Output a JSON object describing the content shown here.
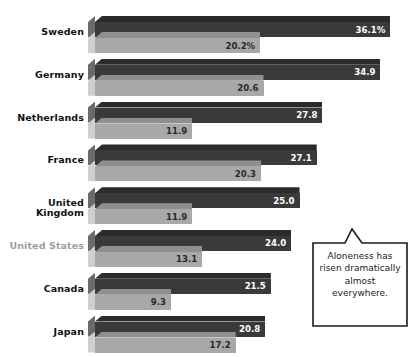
{
  "chart_data": {
    "type": "bar",
    "title": "",
    "subtitle": "",
    "xlabel": "",
    "ylabel": "",
    "orientation": "horizontal",
    "grid": false,
    "legend_position": "top-cropped",
    "xlim": [
      0,
      40
    ],
    "categories": [
      "Sweden",
      "Germany",
      "Netherlands",
      "France",
      "United Kingdom",
      "United States",
      "Canada",
      "Japan"
    ],
    "series": [
      {
        "name": "Recent",
        "color": "#3a3a3a",
        "values": [
          36.1,
          34.9,
          27.8,
          27.1,
          25.0,
          24.0,
          21.5,
          20.8
        ]
      },
      {
        "name": "Earlier",
        "color": "#a8a8a8",
        "values": [
          20.2,
          20.6,
          11.9,
          20.3,
          11.9,
          13.1,
          9.3,
          17.2
        ]
      }
    ],
    "annotations": [
      {
        "text": "Aloneness has risen dramatically almost everywhere.",
        "position": "bottom-right"
      }
    ]
  },
  "legend_remnant": "",
  "rows": [
    {
      "label": "Sweden",
      "muted": false,
      "dark_value": "36.1%",
      "light_value": "20.2%",
      "dark_num": 36.1,
      "light_num": 20.2
    },
    {
      "label": "Germany",
      "muted": false,
      "dark_value": "34.9",
      "light_value": "20.6",
      "dark_num": 34.9,
      "light_num": 20.6
    },
    {
      "label": "Netherlands",
      "muted": false,
      "dark_value": "27.8",
      "light_value": "11.9",
      "dark_num": 27.8,
      "light_num": 11.9
    },
    {
      "label": "France",
      "muted": false,
      "dark_value": "27.1",
      "light_value": "20.3",
      "dark_num": 27.1,
      "light_num": 20.3
    },
    {
      "label": "United Kingdom",
      "muted": false,
      "dark_value": "25.0",
      "light_value": "11.9",
      "dark_num": 25.0,
      "light_num": 11.9
    },
    {
      "label": "United States",
      "muted": true,
      "dark_value": "24.0",
      "light_value": "13.1",
      "dark_num": 24.0,
      "light_num": 13.1
    },
    {
      "label": "Canada",
      "muted": false,
      "dark_value": "21.5",
      "light_value": "9.3",
      "dark_num": 21.5,
      "light_num": 9.3
    },
    {
      "label": "Japan",
      "muted": false,
      "dark_value": "20.8",
      "light_value": "17.2",
      "dark_num": 20.8,
      "light_num": 17.2
    }
  ],
  "callout": {
    "text": "Aloneness has risen dramatically almost everywhere."
  },
  "colors": {
    "dark_bar": "#3a3a3a",
    "light_bar": "#a8a8a8",
    "label": "#111111",
    "label_muted": "#9d9d9d",
    "callout_border": "#1a1a1a"
  }
}
